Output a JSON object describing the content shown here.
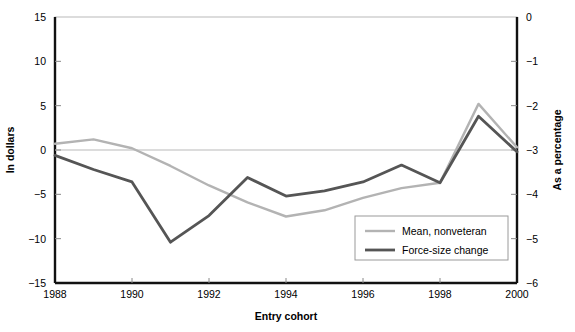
{
  "chart_data": {
    "type": "line",
    "title": "",
    "xlabel": "Entry cohort",
    "ylabel": "In dollars",
    "y2label": "As a percentage",
    "x": [
      1988,
      1989,
      1990,
      1991,
      1992,
      1993,
      1994,
      1995,
      1996,
      1997,
      1998,
      1999,
      2000
    ],
    "xlim": [
      1988,
      2000
    ],
    "ylim": [
      -15,
      15
    ],
    "y2lim": [
      -6,
      0
    ],
    "xticks": [
      1988,
      1990,
      1992,
      1994,
      1996,
      1998,
      2000
    ],
    "xtick_labels": [
      "1988",
      "1990",
      "1992",
      "1994",
      "1996",
      "1998",
      "2000"
    ],
    "yticks": [
      15,
      10,
      5,
      0,
      -5,
      -10,
      -15
    ],
    "ytick_labels": [
      "15",
      "10",
      "5",
      "0",
      "−5",
      "−10",
      "−15"
    ],
    "y2ticks": [
      0,
      -1,
      -2,
      -3,
      -4,
      -5,
      -6
    ],
    "y2tick_labels": [
      "0",
      "−1",
      "−2",
      "−3",
      "−4",
      "−5",
      "−6"
    ],
    "grid": false,
    "zero_line": true,
    "legend_position": "bottom-right",
    "series": [
      {
        "name": "Mean, nonveteran",
        "axis": "left",
        "color": "#b3b3b3",
        "width": 2.4,
        "values": [
          0.7,
          1.2,
          0.2,
          -1.8,
          -4.0,
          -5.9,
          -7.5,
          -6.8,
          -5.4,
          -4.3,
          -3.7,
          5.2,
          0.3
        ]
      },
      {
        "name": "Force-size change",
        "axis": "left",
        "color": "#555555",
        "width": 2.8,
        "values": [
          -0.6,
          -2.2,
          -3.6,
          -10.4,
          -7.4,
          -3.1,
          -5.2,
          -4.6,
          -3.6,
          -1.7,
          -3.7,
          3.8,
          -0.2
        ]
      }
    ]
  },
  "legend": {
    "items": [
      {
        "label": "Mean, nonveteran",
        "color": "#b3b3b3"
      },
      {
        "label": "Force-size change",
        "color": "#555555"
      }
    ]
  }
}
